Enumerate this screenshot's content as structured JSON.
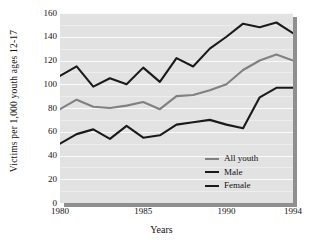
{
  "chart_data": {
    "type": "line",
    "title": "",
    "xlabel": "Years",
    "ylabel": "Victims per 1,000 youth ages 12-17",
    "xlim": [
      1980,
      1994
    ],
    "ylim": [
      0,
      160
    ],
    "grid": true,
    "legend_position": "inside-bottom-right",
    "xticks": [
      "1980",
      "1985",
      "1990",
      "1994"
    ],
    "xtick_values": [
      1980,
      1985,
      1990,
      1994
    ],
    "yticks": [
      "0",
      "20",
      "40",
      "60",
      "80",
      "100",
      "120",
      "140",
      "160"
    ],
    "ytick_values": [
      0,
      20,
      40,
      60,
      80,
      100,
      120,
      140,
      160
    ],
    "x": [
      1980,
      1981,
      1982,
      1983,
      1984,
      1985,
      1986,
      1987,
      1988,
      1989,
      1990,
      1991,
      1992,
      1993,
      1994
    ],
    "series": [
      {
        "name": "All youth",
        "color": "#808080",
        "values": [
          79,
          87,
          81,
          80,
          82,
          85,
          79,
          90,
          91,
          95,
          100,
          112,
          120,
          125,
          120
        ]
      },
      {
        "name": "Male",
        "color": "#1a1a1a",
        "values": [
          107,
          115,
          98,
          105,
          100,
          114,
          102,
          122,
          115,
          130,
          140,
          151,
          148,
          152,
          143
        ]
      },
      {
        "name": "Female",
        "color": "#1a1a1a",
        "values": [
          50,
          58,
          62,
          54,
          65,
          55,
          57,
          66,
          68,
          70,
          66,
          63,
          89,
          97,
          97
        ]
      }
    ],
    "colors": {
      "plot_background": "#e2e2e2",
      "gridline": "#fafafa",
      "shadow": "#8f8f8f",
      "page_background": "#ffffff",
      "text": "#1a1a1a"
    }
  },
  "legend": {
    "items": [
      {
        "label": "All youth",
        "color": "#808080"
      },
      {
        "label": "Male",
        "color": "#1a1a1a"
      },
      {
        "label": "Female",
        "color": "#1a1a1a"
      }
    ]
  }
}
